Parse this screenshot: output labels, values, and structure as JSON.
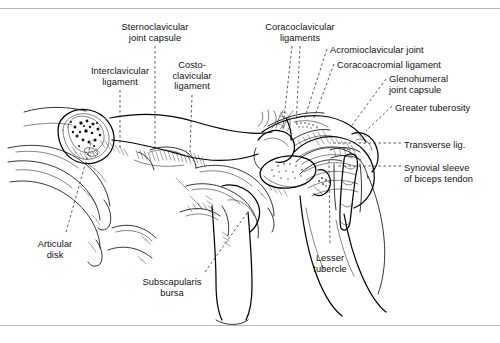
{
  "figure": {
    "ink_color": "#111111",
    "background_color": "#ffffff",
    "rule_color": "#b9b9b9"
  },
  "labels": [
    {
      "id": "sternoclavicular-joint-capsule",
      "lines": [
        "Sternoclavicular",
        "joint capsule"
      ],
      "align": "center",
      "x": 155,
      "y": 22
    },
    {
      "id": "interclavicular-ligament",
      "lines": [
        "Interclavicular",
        "ligament"
      ],
      "align": "center",
      "x": 120,
      "y": 66
    },
    {
      "id": "costoclavicular-ligament",
      "lines": [
        "Costo-",
        "clavicular",
        "ligament"
      ],
      "align": "center",
      "x": 192,
      "y": 60
    },
    {
      "id": "coracoclavicular-ligaments",
      "lines": [
        "Coracoclavicular",
        "ligaments"
      ],
      "align": "center",
      "x": 300,
      "y": 22
    },
    {
      "id": "acromioclavicular-joint",
      "lines": [
        "Acromioclavicular joint"
      ],
      "align": "left",
      "x": 330,
      "y": 45
    },
    {
      "id": "coracoacromial-ligament",
      "lines": [
        "Coracoacromial ligament"
      ],
      "align": "left",
      "x": 337,
      "y": 60
    },
    {
      "id": "glenohumeral-joint-capsule",
      "lines": [
        "Glenohumeral",
        "joint capsule"
      ],
      "align": "left",
      "x": 389,
      "y": 74
    },
    {
      "id": "greater-tuberosity",
      "lines": [
        "Greater tuberosity"
      ],
      "align": "left",
      "x": 395,
      "y": 103
    },
    {
      "id": "transverse-ligament",
      "lines": [
        "Transverse lig."
      ],
      "align": "left",
      "x": 404,
      "y": 140
    },
    {
      "id": "synovial-sleeve-of-biceps-tendon",
      "lines": [
        "Synovial sleeve",
        "of biceps tendon"
      ],
      "align": "left",
      "x": 404,
      "y": 163
    },
    {
      "id": "articular-disk",
      "lines": [
        "Articular",
        "disk"
      ],
      "align": "center",
      "x": 55,
      "y": 239
    },
    {
      "id": "subscapularis-bursa",
      "lines": [
        "Subscapularis",
        "bursa"
      ],
      "align": "center",
      "x": 172,
      "y": 277
    },
    {
      "id": "lesser-tubercle",
      "lines": [
        "Lesser",
        "tubercle"
      ],
      "align": "center",
      "x": 330,
      "y": 253
    }
  ],
  "leaders": [
    {
      "id": "leader-sternoclavicular-joint-capsule",
      "points": "155,46 155,150"
    },
    {
      "id": "leader-interclavicular-ligament",
      "points": "120,90 120,150"
    },
    {
      "id": "leader-costoclavicular-ligament",
      "points": "192,95 190,152"
    },
    {
      "id": "leader-coracoclavicular-ligaments-a",
      "points": "292,46 283,128"
    },
    {
      "id": "leader-coracoclavicular-ligaments-b",
      "points": "300,46 296,126"
    },
    {
      "id": "leader-acromioclavicular-joint",
      "points": "327,49 304,120"
    },
    {
      "id": "leader-coracoacromial-ligament",
      "points": "334,64 314,118"
    },
    {
      "id": "leader-glenohumeral-joint-capsule",
      "points": "386,79 352,125"
    },
    {
      "id": "leader-greater-tuberosity",
      "points": "392,106 366,131"
    },
    {
      "id": "leader-transverse-ligament",
      "points": "401,143 330,143"
    },
    {
      "id": "leader-synovial-sleeve",
      "points": "401,166 337,166"
    },
    {
      "id": "leader-articular-disk",
      "points": "66,232 92,140"
    },
    {
      "id": "leader-subscapularis-bursa",
      "points": "205,272 247,213"
    },
    {
      "id": "leader-lesser-tubercle",
      "points": "330,243 329,160"
    }
  ]
}
